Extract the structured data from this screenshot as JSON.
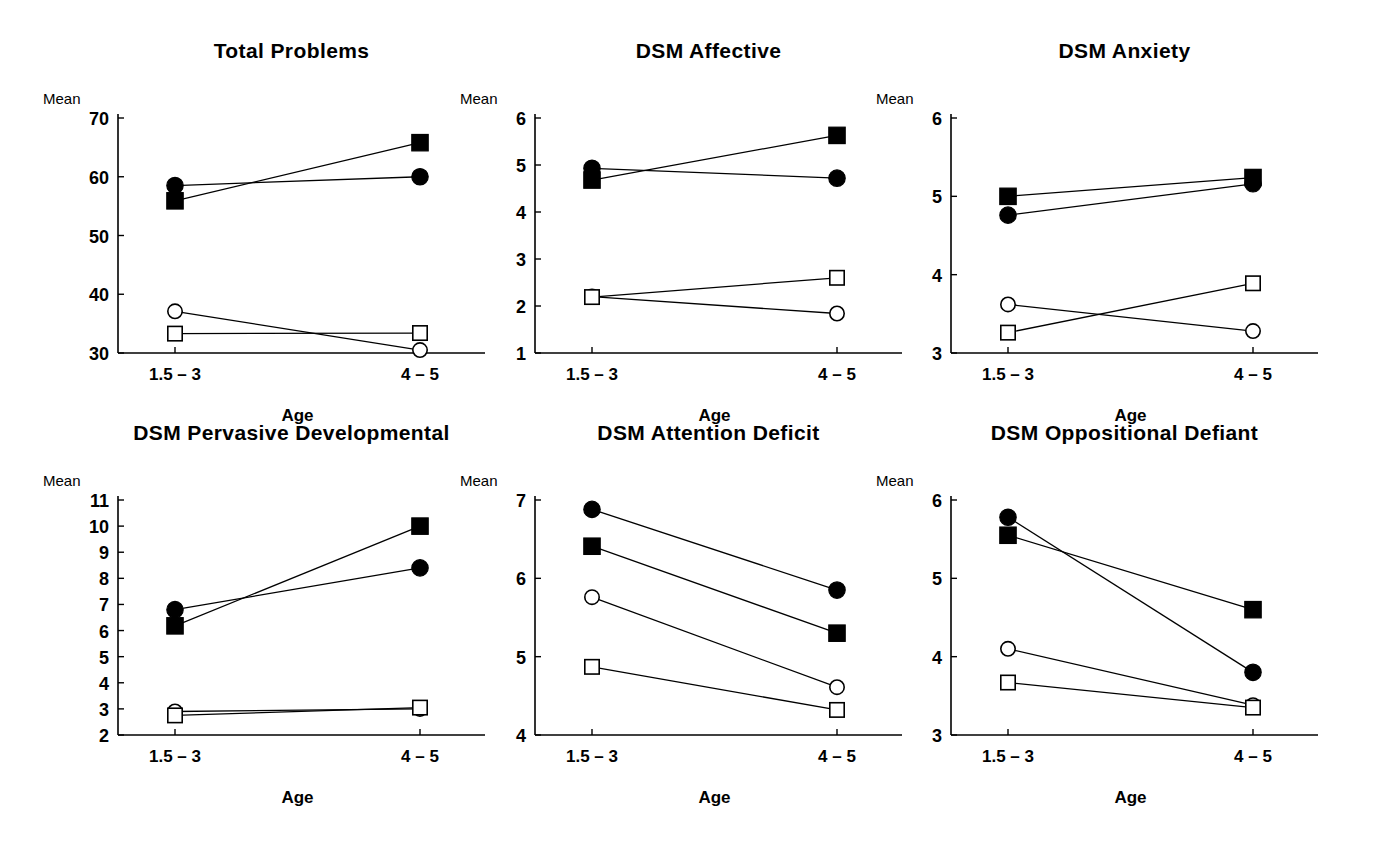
{
  "figure": {
    "background": "#ffffff",
    "foreground": "#000000",
    "width": 1380,
    "height": 850,
    "rows": 2,
    "cols": 3
  },
  "labels": {
    "y_axis_name": "Mean",
    "x_axis_name": "Age",
    "category_1": "1.5 – 3",
    "category_2": "4 – 5"
  },
  "series_styles": [
    {
      "key": "filled-circle",
      "marker": "circle",
      "fill": "#000000"
    },
    {
      "key": "filled-square",
      "marker": "square",
      "fill": "#000000"
    },
    {
      "key": "open-circle",
      "marker": "circle",
      "fill": "#ffffff"
    },
    {
      "key": "open-square",
      "marker": "square",
      "fill": "#ffffff"
    }
  ],
  "chart_data": [
    {
      "type": "line",
      "title": "Total Problems",
      "xlabel": "Age",
      "ylabel": "Mean",
      "categories": [
        "1.5 – 3",
        "4 – 5"
      ],
      "ylim": [
        30,
        70
      ],
      "yticks": [
        30,
        40,
        50,
        60,
        70
      ],
      "grid": false,
      "legend": "none",
      "series": [
        {
          "name": "filled-circle",
          "values": [
            58.5,
            60.0
          ]
        },
        {
          "name": "filled-square",
          "values": [
            55.9,
            65.8
          ]
        },
        {
          "name": "open-circle",
          "values": [
            37.1,
            30.5
          ]
        },
        {
          "name": "open-square",
          "values": [
            33.3,
            33.4
          ]
        }
      ]
    },
    {
      "type": "line",
      "title": "DSM Affective",
      "xlabel": "Age",
      "ylabel": "Mean",
      "categories": [
        "1.5 – 3",
        "4 – 5"
      ],
      "ylim": [
        1,
        6
      ],
      "yticks": [
        1,
        2,
        3,
        4,
        5,
        6
      ],
      "grid": false,
      "legend": "none",
      "series": [
        {
          "name": "filled-circle",
          "values": [
            4.93,
            4.72
          ]
        },
        {
          "name": "filled-square",
          "values": [
            4.68,
            5.63
          ]
        },
        {
          "name": "open-circle",
          "values": [
            2.2,
            1.84
          ]
        },
        {
          "name": "open-square",
          "values": [
            2.19,
            2.6
          ]
        }
      ]
    },
    {
      "type": "line",
      "title": "DSM Anxiety",
      "xlabel": "Age",
      "ylabel": "Mean",
      "categories": [
        "1.5 – 3",
        "4 – 5"
      ],
      "ylim": [
        3,
        6
      ],
      "yticks": [
        3,
        4,
        5,
        6
      ],
      "grid": false,
      "legend": "none",
      "series": [
        {
          "name": "filled-circle",
          "values": [
            4.76,
            5.16
          ]
        },
        {
          "name": "filled-square",
          "values": [
            5.0,
            5.24
          ]
        },
        {
          "name": "open-circle",
          "values": [
            3.62,
            3.28
          ]
        },
        {
          "name": "open-square",
          "values": [
            3.26,
            3.89
          ]
        }
      ]
    },
    {
      "type": "line",
      "title": "DSM Pervasive Developmental",
      "xlabel": "Age",
      "ylabel": "Mean",
      "categories": [
        "1.5 – 3",
        "4 – 5"
      ],
      "ylim": [
        2,
        11
      ],
      "yticks": [
        2,
        3,
        4,
        5,
        6,
        7,
        8,
        9,
        10,
        11
      ],
      "grid": false,
      "legend": "none",
      "series": [
        {
          "name": "filled-circle",
          "values": [
            6.8,
            8.4
          ]
        },
        {
          "name": "filled-square",
          "values": [
            6.18,
            10.0
          ]
        },
        {
          "name": "open-circle",
          "values": [
            2.9,
            3.0
          ]
        },
        {
          "name": "open-square",
          "values": [
            2.75,
            3.05
          ]
        }
      ]
    },
    {
      "type": "line",
      "title": "DSM Attention Deficit",
      "xlabel": "Age",
      "ylabel": "Mean",
      "categories": [
        "1.5 – 3",
        "4 – 5"
      ],
      "ylim": [
        4,
        7
      ],
      "yticks": [
        4,
        5,
        6,
        7
      ],
      "grid": false,
      "legend": "none",
      "series": [
        {
          "name": "filled-circle",
          "values": [
            6.88,
            5.85
          ]
        },
        {
          "name": "filled-square",
          "values": [
            6.41,
            5.3
          ]
        },
        {
          "name": "open-circle",
          "values": [
            5.76,
            4.61
          ]
        },
        {
          "name": "open-square",
          "values": [
            4.87,
            4.32
          ]
        }
      ]
    },
    {
      "type": "line",
      "title": "DSM Oppositional Defiant",
      "xlabel": "Age",
      "ylabel": "Mean",
      "categories": [
        "1.5 – 3",
        "4 – 5"
      ],
      "ylim": [
        3,
        6
      ],
      "yticks": [
        3,
        4,
        5,
        6
      ],
      "grid": false,
      "legend": "none",
      "series": [
        {
          "name": "filled-circle",
          "values": [
            5.78,
            3.8
          ]
        },
        {
          "name": "filled-square",
          "values": [
            5.55,
            4.6
          ]
        },
        {
          "name": "open-circle",
          "values": [
            4.1,
            3.38
          ]
        },
        {
          "name": "open-square",
          "values": [
            3.67,
            3.35
          ]
        }
      ]
    }
  ],
  "panel_geometry": [
    {
      "left": 35,
      "top": 30,
      "width": 450,
      "height": 400
    },
    {
      "left": 452,
      "top": 30,
      "width": 450,
      "height": 400
    },
    {
      "left": 868,
      "top": 30,
      "width": 455,
      "height": 400
    },
    {
      "left": 35,
      "top": 412,
      "width": 450,
      "height": 420
    },
    {
      "left": 452,
      "top": 412,
      "width": 450,
      "height": 420
    },
    {
      "left": 868,
      "top": 412,
      "width": 455,
      "height": 420
    }
  ]
}
